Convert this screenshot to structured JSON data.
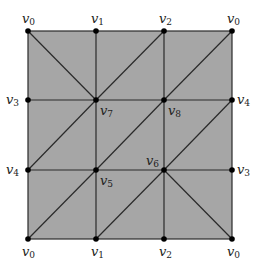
{
  "diagram": {
    "fill_color": "#a6a6a6",
    "line_color": "#2a2a2a",
    "vertex_color": "#000000",
    "grid": {
      "xs": [
        28,
        96,
        164,
        232
      ],
      "ys": [
        31,
        100,
        170,
        239
      ]
    },
    "vertices": [
      {
        "id": "top-0-left",
        "name": "v",
        "sub": "0",
        "x": 28,
        "y": 31,
        "lx": 22,
        "ly": 12
      },
      {
        "id": "top-1",
        "name": "v",
        "sub": "1",
        "x": 96,
        "y": 31,
        "lx": 91,
        "ly": 12
      },
      {
        "id": "top-2",
        "name": "v",
        "sub": "2",
        "x": 164,
        "y": 31,
        "lx": 159,
        "ly": 12
      },
      {
        "id": "top-0-right",
        "name": "v",
        "sub": "0",
        "x": 232,
        "y": 31,
        "lx": 227,
        "ly": 12
      },
      {
        "id": "left-3",
        "name": "v",
        "sub": "3",
        "x": 28,
        "y": 100,
        "lx": 6,
        "ly": 93
      },
      {
        "id": "mid-7",
        "name": "v",
        "sub": "7",
        "x": 96,
        "y": 100,
        "lx": 100,
        "ly": 104
      },
      {
        "id": "mid-8",
        "name": "v",
        "sub": "8",
        "x": 164,
        "y": 100,
        "lx": 168,
        "ly": 104
      },
      {
        "id": "right-4",
        "name": "v",
        "sub": "4",
        "x": 232,
        "y": 100,
        "lx": 237,
        "ly": 93
      },
      {
        "id": "left-4",
        "name": "v",
        "sub": "4",
        "x": 28,
        "y": 170,
        "lx": 6,
        "ly": 163
      },
      {
        "id": "mid-5",
        "name": "v",
        "sub": "5",
        "x": 96,
        "y": 170,
        "lx": 100,
        "ly": 174
      },
      {
        "id": "mid-6",
        "name": "v",
        "sub": "6",
        "x": 164,
        "y": 170,
        "lx": 146,
        "ly": 154
      },
      {
        "id": "right-3",
        "name": "v",
        "sub": "3",
        "x": 232,
        "y": 170,
        "lx": 237,
        "ly": 163
      },
      {
        "id": "bottom-0-left",
        "name": "v",
        "sub": "0",
        "x": 28,
        "y": 239,
        "lx": 22,
        "ly": 245
      },
      {
        "id": "bottom-1",
        "name": "v",
        "sub": "1",
        "x": 96,
        "y": 239,
        "lx": 91,
        "ly": 245
      },
      {
        "id": "bottom-2",
        "name": "v",
        "sub": "2",
        "x": 164,
        "y": 239,
        "lx": 159,
        "ly": 245
      },
      {
        "id": "bottom-0-right",
        "name": "v",
        "sub": "0",
        "x": 232,
        "y": 239,
        "lx": 227,
        "ly": 245
      }
    ],
    "diagonals": [
      {
        "from": [
          28,
          31
        ],
        "to": [
          96,
          100
        ]
      },
      {
        "from": [
          96,
          100
        ],
        "to": [
          164,
          31
        ]
      },
      {
        "from": [
          164,
          100
        ],
        "to": [
          232,
          31
        ]
      },
      {
        "from": [
          28,
          170
        ],
        "to": [
          96,
          100
        ]
      },
      {
        "from": [
          96,
          170
        ],
        "to": [
          164,
          100
        ]
      },
      {
        "from": [
          164,
          170
        ],
        "to": [
          232,
          100
        ]
      },
      {
        "from": [
          28,
          239
        ],
        "to": [
          96,
          170
        ]
      },
      {
        "from": [
          96,
          239
        ],
        "to": [
          164,
          170
        ]
      },
      {
        "from": [
          164,
          170
        ],
        "to": [
          232,
          239
        ]
      }
    ]
  }
}
